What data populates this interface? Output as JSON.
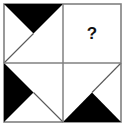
{
  "figure": {
    "question_mark": "?",
    "colors": {
      "fill_black": "#000000",
      "background_white": "#ffffff",
      "border_gray": "#808080",
      "thin_line_gray": "#595959",
      "text_black": "#111111"
    },
    "geometry": {
      "outer_box": {
        "x": 4,
        "y": 4,
        "width": 117,
        "height": 118
      },
      "center_x": 63,
      "center_y": 63,
      "border_width": 1.6,
      "thin_line_width": 1.1
    },
    "cells": [
      {
        "id": "cell-top-left",
        "position": "top-left",
        "shape": "black-triangle",
        "fill": "#000000",
        "apex": "quadrant-center",
        "points": "4,4 63,4 33.5,33.5",
        "thin_line": "33.5,33.5 4,63",
        "has_question_mark": false
      },
      {
        "id": "cell-top-right",
        "position": "top-right",
        "shape": "empty",
        "fill": "#ffffff",
        "apex": "",
        "points": "",
        "thin_line": "",
        "has_question_mark": true
      },
      {
        "id": "cell-bottom-left",
        "position": "bottom-left",
        "shape": "black-triangle",
        "fill": "#000000",
        "apex": "quadrant-center",
        "points": "4,63 4,122 33.5,92.5",
        "thin_line": "33.5,92.5 63,122",
        "has_question_mark": false
      },
      {
        "id": "cell-bottom-right",
        "position": "bottom-right",
        "shape": "black-triangle",
        "fill": "#000000",
        "apex": "quadrant-center",
        "points": "63,122 121,122 92,92.5",
        "thin_line": "92,92.5 121,63",
        "has_question_mark": false
      }
    ]
  }
}
